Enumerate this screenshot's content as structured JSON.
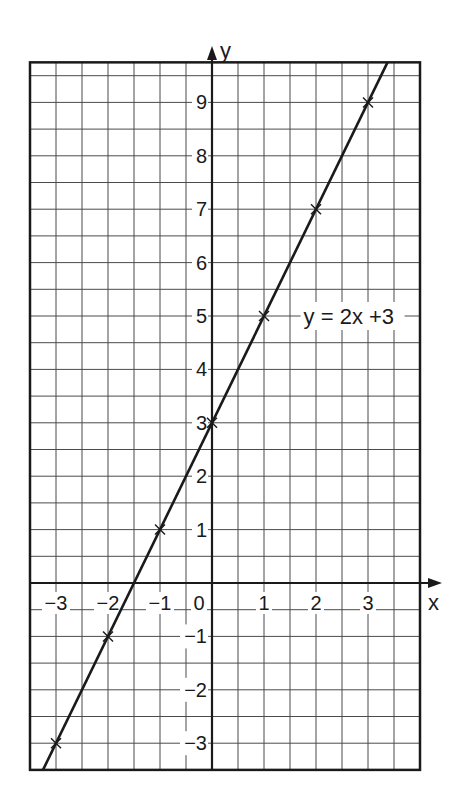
{
  "chart_data": {
    "type": "line",
    "title": "",
    "xlabel": "x",
    "ylabel": "y",
    "xlim": [
      -3.5,
      4
    ],
    "ylim": [
      -3.5,
      9.75
    ],
    "grid": true,
    "grid_step": 0.5,
    "x_ticks": [
      -3,
      -2,
      -1,
      0,
      1,
      2,
      3
    ],
    "x_tick_labels": [
      "−3",
      "−2",
      "−1",
      "0",
      "1",
      "2",
      "3"
    ],
    "y_ticks": [
      -3,
      -2,
      -1,
      1,
      2,
      3,
      4,
      5,
      6,
      7,
      8,
      9
    ],
    "y_tick_labels": [
      "−3",
      "−2",
      "−1",
      "1",
      "2",
      "3",
      "4",
      "5",
      "6",
      "7",
      "8",
      "9"
    ],
    "series": [
      {
        "name": "y = 2x +3",
        "equation": "y = 2x + 3",
        "slope": 2,
        "intercept": 3,
        "x": [
          -3,
          -2,
          -1,
          0,
          1,
          2,
          3
        ],
        "y": [
          -3,
          -1,
          1,
          3,
          5,
          7,
          9
        ],
        "marker": "x",
        "color": "#1a1a1a"
      }
    ],
    "annotations": [
      {
        "text": "y = 2x +3",
        "x": 1.55,
        "y": 5
      }
    ],
    "legend": "none"
  },
  "labels": {
    "x_axis": "x",
    "y_axis": "y",
    "equation": "y = 2x +3"
  },
  "colors": {
    "ink": "#1a1a1a",
    "grid": "#4a4a4a",
    "paper": "#ffffff"
  }
}
